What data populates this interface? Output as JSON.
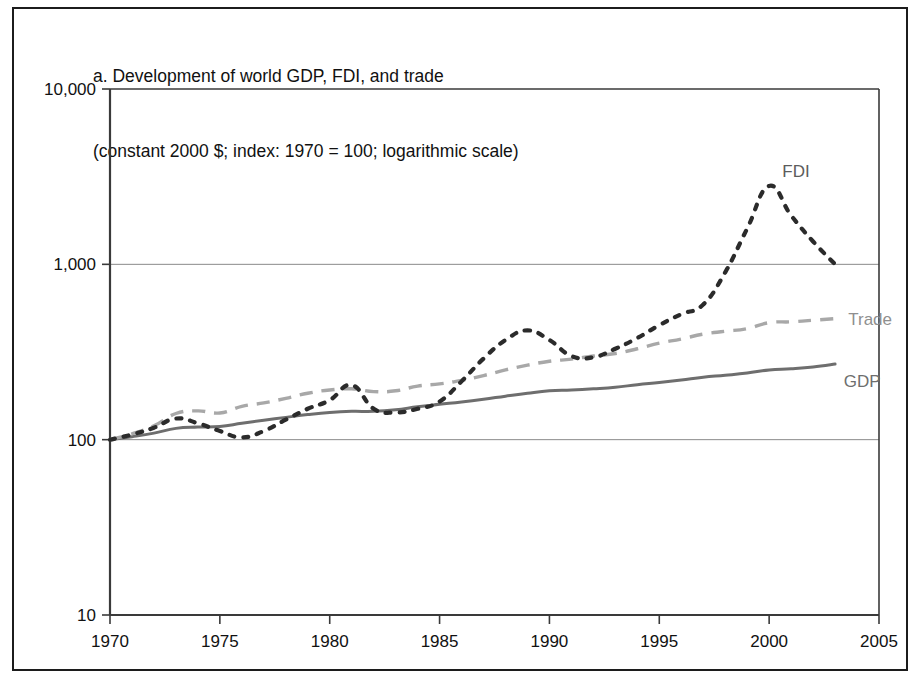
{
  "figure": {
    "title_line_1": "a. Development of world GDP, FDI, and trade",
    "title_line_2": "(constant 2000 $; index: 1970 = 100; logarithmic scale)"
  },
  "colors": {
    "frame": "#1c1c1c",
    "axis": "#3a3a3a",
    "gridline": "#8a8a8a",
    "gdp": "#6e6e6e",
    "trade": "#a8a8a8",
    "fdi": "#2b2b2b",
    "background": "#ffffff"
  },
  "labels": {
    "fdi": "FDI",
    "trade": "Trade",
    "gdp": "GDP"
  },
  "chart_data": {
    "type": "line",
    "title": "a. Development of world GDP, FDI, and trade",
    "subtitle": "(constant 2000 $; index: 1970 = 100; logarithmic scale)",
    "xlabel": "",
    "ylabel": "",
    "yscale": "log",
    "ylim": [
      10,
      10000
    ],
    "xlim": [
      1970,
      2005
    ],
    "ytick_labels": [
      "10,000",
      "1,000",
      "100",
      "10"
    ],
    "ytick_values": [
      10000,
      1000,
      100,
      10
    ],
    "xtick_labels": [
      "1970",
      "1975",
      "1980",
      "1985",
      "1990",
      "1995",
      "2000",
      "2005"
    ],
    "xtick_values": [
      1970,
      1975,
      1980,
      1985,
      1990,
      1995,
      2000,
      2005
    ],
    "grid": true,
    "legend_position": "inline-end-of-line",
    "x": [
      1970,
      1971,
      1972,
      1973,
      1974,
      1975,
      1976,
      1977,
      1978,
      1979,
      1980,
      1981,
      1982,
      1983,
      1984,
      1985,
      1986,
      1987,
      1988,
      1989,
      1990,
      1991,
      1992,
      1993,
      1994,
      1995,
      1996,
      1997,
      1998,
      1999,
      2000,
      2001,
      2002,
      2003
    ],
    "series": [
      {
        "name": "GDP",
        "style": "solid",
        "color": "#6e6e6e",
        "values": [
          100,
          104,
          109,
          116,
          118,
          119,
          124,
          129,
          134,
          139,
          143,
          145,
          145,
          148,
          154,
          159,
          164,
          170,
          177,
          184,
          190,
          192,
          195,
          199,
          206,
          212,
          219,
          227,
          233,
          240,
          250,
          254,
          260,
          270
        ]
      },
      {
        "name": "Trade",
        "style": "dashed",
        "color": "#a8a8a8",
        "values": [
          100,
          108,
          120,
          141,
          146,
          142,
          155,
          162,
          172,
          184,
          192,
          195,
          188,
          190,
          202,
          208,
          218,
          232,
          250,
          266,
          280,
          288,
          300,
          310,
          330,
          355,
          375,
          400,
          415,
          430,
          465,
          470,
          480,
          490
        ]
      },
      {
        "name": "FDI",
        "style": "dotted",
        "color": "#2b2b2b",
        "values": [
          100,
          107,
          117,
          132,
          124,
          112,
          103,
          112,
          130,
          150,
          168,
          205,
          150,
          143,
          150,
          165,
          215,
          290,
          370,
          420,
          370,
          300,
          295,
          330,
          380,
          450,
          520,
          590,
          900,
          1600,
          2800,
          1900,
          1350,
          1000
        ]
      }
    ],
    "annotations": [
      {
        "text": "FDI",
        "x": 2000.6,
        "y": 3400
      },
      {
        "text": "Trade",
        "x": 2003.6,
        "y": 490
      },
      {
        "text": "GDP",
        "x": 2003.4,
        "y": 215
      }
    ]
  }
}
